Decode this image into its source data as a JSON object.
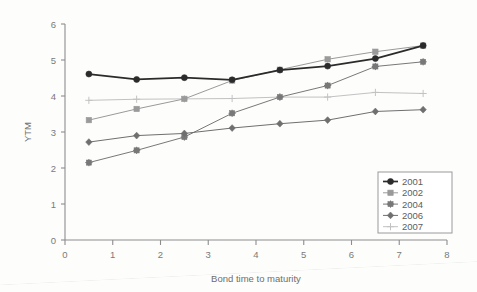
{
  "chart_data": {
    "type": "line",
    "title": "",
    "xlabel": "Bond time to maturity",
    "ylabel": "YTM",
    "xlim": [
      0,
      8
    ],
    "ylim": [
      0,
      6
    ],
    "xticks": [
      "0",
      "1",
      "2",
      "3",
      "4",
      "5",
      "6",
      "7",
      "8"
    ],
    "yticks": [
      "0",
      "1",
      "2",
      "3",
      "4",
      "5",
      "6"
    ],
    "grid": false,
    "legend_position": "bottom-right",
    "x": [
      0.5,
      1.5,
      2.5,
      3.5,
      4.5,
      5.5,
      6.5,
      7.5
    ],
    "series": [
      {
        "name": "2001",
        "marker": "filled-circle",
        "color": "#2b2b2b",
        "values": [
          4.61,
          4.46,
          4.51,
          4.45,
          4.72,
          4.83,
          5.04,
          5.4
        ]
      },
      {
        "name": "2002",
        "marker": "filled-square",
        "color": "#9a9a9a",
        "values": [
          3.33,
          3.64,
          3.92,
          4.43,
          4.73,
          5.02,
          5.23,
          5.4
        ]
      },
      {
        "name": "2004",
        "marker": "asterisk-square",
        "color": "#787878",
        "values": [
          2.15,
          2.49,
          2.86,
          3.52,
          3.97,
          4.29,
          4.82,
          4.95
        ]
      },
      {
        "name": "2006",
        "marker": "filled-diamond",
        "color": "#6f6f6f",
        "values": [
          2.72,
          2.9,
          2.96,
          3.11,
          3.23,
          3.33,
          3.57,
          3.62
        ]
      },
      {
        "name": "2007",
        "marker": "plus",
        "color": "#c2c2c2",
        "values": [
          3.88,
          3.91,
          3.92,
          3.93,
          3.97,
          3.97,
          4.1,
          4.07
        ]
      }
    ]
  },
  "legend": {
    "entries": [
      "2001",
      "2002",
      "2004",
      "2006",
      "2007"
    ]
  },
  "axes": {
    "x_title": "Bond time to maturity",
    "y_title": "YTM"
  }
}
